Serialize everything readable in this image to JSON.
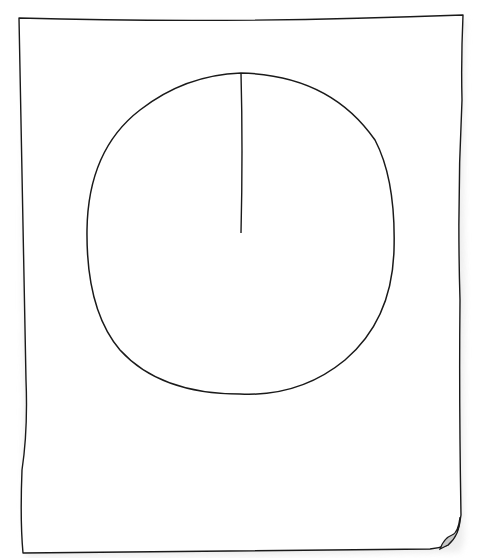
{
  "sketch": {
    "subject": "hand-drawn paper sheet with circle and radius line",
    "colors": {
      "background": "#ffffff",
      "stroke": "#1a1a1a",
      "paper": "#ffffff",
      "shadow": "#e6e6e6",
      "page_curl": "#c8c8c8"
    },
    "paper": {
      "top_left": [
        19,
        17
      ],
      "top_right": [
        463,
        15
      ],
      "bottom_right": [
        460,
        540
      ],
      "bottom_left": [
        22,
        553
      ]
    },
    "circle": {
      "center": [
        240,
        232
      ],
      "radius_x": 154,
      "radius_y": 160
    },
    "radius_line": {
      "from": [
        241,
        73
      ],
      "to": [
        241,
        233
      ]
    }
  }
}
